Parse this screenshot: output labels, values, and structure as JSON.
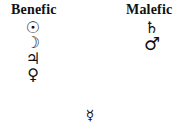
{
  "columns": {
    "benefic": {
      "label": "Benefic",
      "planets": [
        {
          "name": "Sun",
          "symbol": "☉"
        },
        {
          "name": "Moon",
          "symbol": "☽"
        },
        {
          "name": "Jupiter",
          "symbol": "♃"
        },
        {
          "name": "Venus",
          "symbol": "♀"
        }
      ]
    },
    "malefic": {
      "label": "Malefic",
      "planets": [
        {
          "name": "Saturn",
          "symbol": "♄"
        },
        {
          "name": "Mars",
          "symbol": "♂"
        }
      ]
    },
    "neutral": {
      "planets": [
        {
          "name": "Mercury",
          "symbol": "☿"
        }
      ]
    }
  }
}
